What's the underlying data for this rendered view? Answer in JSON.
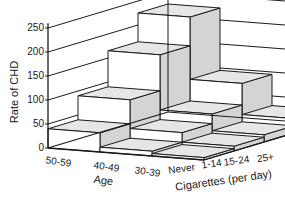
{
  "chart_data": {
    "type": "bar",
    "subtype": "3d-bar",
    "title": "",
    "ylabel": "Rate of CHD",
    "xlabel": "Age",
    "zlabel": "Cigarettes (per day)",
    "ylim": [
      0,
      250
    ],
    "yticks": [
      0,
      50,
      100,
      150,
      200,
      250
    ],
    "grid": true,
    "age_categories": [
      "50-59",
      "40-49",
      "30-39"
    ],
    "cigarette_categories": [
      "Never",
      "1-14",
      "15-24",
      "25+"
    ],
    "series": [
      {
        "name": "50-59",
        "values": [
          40,
          90,
          165,
          225
        ]
      },
      {
        "name": "40-49",
        "values": [
          10,
          30,
          50,
          95
        ]
      },
      {
        "name": "30-39",
        "values": [
          5,
          10,
          15,
          30
        ]
      }
    ],
    "colors": {
      "front": "#ffffff",
      "side": "#d4d4d4",
      "top": "#e6e6e6",
      "line": "#1a1a1a"
    }
  },
  "axis": {
    "yticks": [
      "0",
      "50",
      "100",
      "150",
      "200",
      "250"
    ],
    "age_labels": [
      "50-59",
      "40-49",
      "30-39"
    ],
    "cig_labels": [
      "Never",
      "1-14",
      "15-24",
      "25+"
    ],
    "ylabel": "Rate of CHD",
    "age_title": "Age",
    "cig_title": "Cigarettes (per day)"
  }
}
